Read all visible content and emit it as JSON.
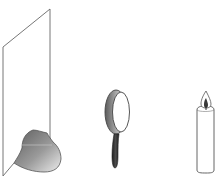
{
  "diagram": {
    "title": "",
    "objects": [
      {
        "name": "screen",
        "label": ""
      },
      {
        "name": "magnifying-glass",
        "label": ""
      },
      {
        "name": "candle",
        "label": ""
      }
    ],
    "colors": {
      "outline": "#555555",
      "image_dark": "#6e6e6e",
      "image_light": "#e6e6e6",
      "handle": "#2e2e2e",
      "flame": "#3a3a3a"
    }
  }
}
